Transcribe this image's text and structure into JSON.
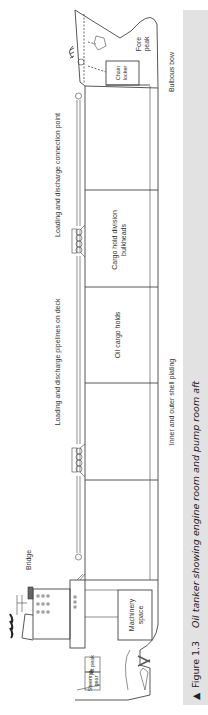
{
  "figure": {
    "number_label": "Figure 1.3",
    "title": "Oil tanker showing engine room and pump room aft",
    "marker": "▲",
    "caption_bg": "#e2e2e2"
  },
  "labels": {
    "fore_peak": [
      "Fore",
      "peak"
    ],
    "chain_locker": [
      "Chain",
      "locker"
    ],
    "bulbous_bow": "Bulbous bow",
    "connection_point": "Loading and discharge connection point",
    "pipelines_on_deck": "Loading and discharge pipelines on deck",
    "cargo_hold_division": [
      "Cargo hold division",
      "bulkheads"
    ],
    "oil_cargo_holds": "Oil cargo holds",
    "inner_outer_plating": "Inner and outer shell plating",
    "bridge": "Bridge",
    "machinery_space": [
      "Machinery",
      "space"
    ],
    "steering_gear": [
      "Steering",
      "gear"
    ],
    "aft_peak": "Aft peak"
  },
  "colors": {
    "line": "#444444",
    "text": "#333333",
    "caption_bg": "#e2e2e2"
  }
}
